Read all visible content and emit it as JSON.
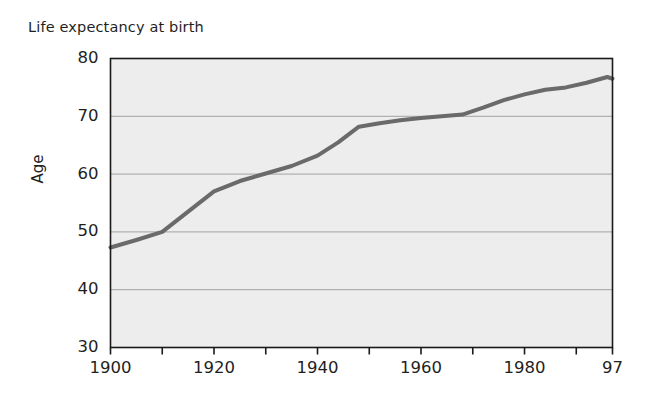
{
  "chart_data": {
    "type": "line",
    "title": "Life expectancy at birth",
    "xlabel": "",
    "ylabel": "Age",
    "xlim": [
      1900,
      1997
    ],
    "ylim": [
      30,
      80
    ],
    "grid": true,
    "legend": null,
    "y_ticks": [
      80,
      70,
      60,
      50,
      40,
      30
    ],
    "y_tick_labels": [
      "80",
      "70",
      "60",
      "50",
      "40",
      "30"
    ],
    "x_ticks": [
      1900,
      1910,
      1920,
      1930,
      1940,
      1950,
      1960,
      1970,
      1980,
      1990,
      1997
    ],
    "x_tick_labels": [
      "1900",
      "",
      "1920",
      "",
      "1940",
      "",
      "1960",
      "",
      "1980",
      "",
      "97"
    ],
    "x_labeled_ticks": [
      {
        "value": 1900,
        "label": "1900"
      },
      {
        "value": 1920,
        "label": "1920"
      },
      {
        "value": 1940,
        "label": "1940"
      },
      {
        "value": 1960,
        "label": "1960"
      },
      {
        "value": 1980,
        "label": "1980"
      },
      {
        "value": 1997,
        "label": "97"
      }
    ],
    "series": [
      {
        "name": "Life expectancy at birth",
        "color": "#6a6a6a",
        "line_width": 4,
        "x": [
          1900,
          1905,
          1910,
          1915,
          1920,
          1925,
          1930,
          1935,
          1940,
          1944,
          1948,
          1952,
          1956,
          1960,
          1964,
          1968,
          1972,
          1976,
          1980,
          1984,
          1988,
          1992,
          1996,
          1997
        ],
        "y": [
          47.3,
          48.6,
          50.0,
          53.5,
          57.0,
          58.8,
          60.1,
          61.4,
          63.2,
          65.5,
          68.2,
          68.8,
          69.3,
          69.7,
          70.0,
          70.3,
          71.5,
          72.8,
          73.8,
          74.6,
          75.0,
          75.8,
          76.8,
          76.5
        ]
      }
    ],
    "notes": [
      "Line rises sharply 1910-1920",
      "Steep rise 1940-1948 then plateau through the 1960s",
      "Slight dip at the final point"
    ]
  },
  "style": {
    "plot_background": "#ededed",
    "page_background": "#ffffff",
    "axis_color": "#1a1a1a",
    "gridline_color": "#9a9a9a",
    "line_color": "#6a6a6a"
  }
}
